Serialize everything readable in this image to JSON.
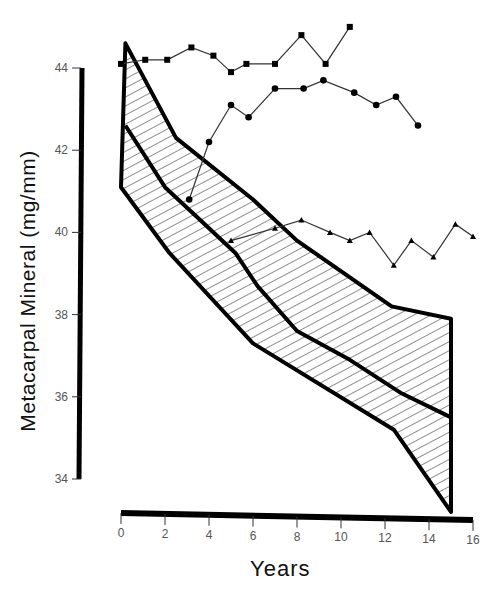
{
  "chart_data": {
    "type": "line",
    "title": "",
    "xlabel": "Years",
    "ylabel": "Metacarpal Mineral (mg/mm)",
    "xlim": [
      0,
      16
    ],
    "ylim": [
      34,
      44
    ],
    "x_ticks": [
      "0",
      "2",
      "4",
      "6",
      "8",
      "10",
      "12",
      "14",
      "16"
    ],
    "y_ticks": [
      "34",
      "36",
      "38",
      "40",
      "42",
      "44"
    ],
    "grid": false,
    "legend": null,
    "band": {
      "description": "Hatched range band with mean line (decline in metacarpal mineral)",
      "upper": {
        "x": [
          0.2,
          2.5,
          6,
          8,
          12.3,
          15
        ],
        "y": [
          44.6,
          42.3,
          40.8,
          39.8,
          38.2,
          37.9
        ]
      },
      "middle": {
        "x": [
          0.2,
          2,
          3.6,
          5.2,
          6.2,
          8,
          10.4,
          12.7,
          15
        ],
        "y": [
          42.6,
          41.1,
          40.3,
          39.5,
          38.7,
          37.6,
          36.9,
          36.1,
          35.5
        ]
      },
      "lower": {
        "x": [
          0,
          2.2,
          6,
          12.4,
          15
        ],
        "y": [
          41.1,
          39.5,
          37.3,
          35.2,
          33.2
        ]
      }
    },
    "series": [
      {
        "name": "Subject A (squares)",
        "marker": "square",
        "x": [
          0,
          1.1,
          2.1,
          3.2,
          4.2,
          5,
          5.7,
          7,
          8.2,
          9.3,
          10.4
        ],
        "y": [
          44.1,
          44.2,
          44.2,
          44.5,
          44.3,
          43.9,
          44.1,
          44.1,
          44.8,
          44.1,
          45.0
        ]
      },
      {
        "name": "Subject B (circles)",
        "marker": "circle",
        "x": [
          3.1,
          4,
          5,
          5.8,
          7,
          8.3,
          9.2,
          10.6,
          11.6,
          12.5,
          13.5
        ],
        "y": [
          40.8,
          42.2,
          43.1,
          42.8,
          43.5,
          43.5,
          43.7,
          43.4,
          43.1,
          43.3,
          42.6
        ]
      },
      {
        "name": "Subject C (triangles)",
        "marker": "triangle",
        "x": [
          5,
          7,
          8.2,
          9.5,
          10.4,
          11.3,
          12.4,
          13.2,
          14.2,
          15.2,
          16
        ],
        "y": [
          39.8,
          40.1,
          40.3,
          40.0,
          39.8,
          40.0,
          39.2,
          39.8,
          39.4,
          40.2,
          39.9
        ]
      }
    ]
  },
  "labels": {
    "ylabel": "Metacarpal Mineral (mg/mm)",
    "xlabel": "Years"
  }
}
